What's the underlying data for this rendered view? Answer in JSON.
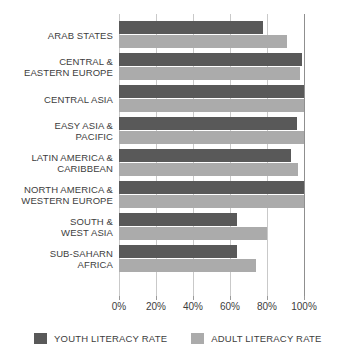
{
  "chart_data": {
    "type": "bar",
    "orientation": "horizontal",
    "title": "",
    "xlabel": "",
    "ylabel": "",
    "xlim": [
      0,
      100
    ],
    "grid": true,
    "legend_position": "bottom",
    "categories": [
      "ARAB STATES",
      "CENTRAL &\nEASTERN EUROPE",
      "CENTRAL ASIA",
      "EASY ASIA &\nPACIFIC",
      "LATIN AMERICA &\nCARIBBEAN",
      "NORTH AMERICA &\nWESTERN EUROPE",
      "SOUTH &\nWEST ASIA",
      "SUB-SAHARN\nAFRICA"
    ],
    "series": [
      {
        "name": "YOUTH LITERACY RATE",
        "color": "#595959",
        "values": [
          78,
          99,
          100,
          96,
          93,
          100,
          64,
          64
        ]
      },
      {
        "name": "ADULT LITERACY RATE",
        "color": "#ababab",
        "values": [
          91,
          98,
          100,
          100,
          97,
          100,
          80,
          74
        ]
      }
    ],
    "xticks": [
      0,
      20,
      40,
      60,
      80,
      100
    ],
    "xtick_labels": [
      "0%",
      "20%",
      "40%",
      "60%",
      "80%",
      "100%"
    ]
  },
  "legend": {
    "items": [
      {
        "label": "YOUTH LITERACY RATE"
      },
      {
        "label": "ADULT LITERACY RATE"
      }
    ]
  },
  "colors": {
    "youth": "#595959",
    "adult": "#ababab",
    "gridline": "#c9c9c9",
    "axis": "#9a9a9a",
    "text": "#3d3d3d",
    "background": "#ffffff"
  }
}
